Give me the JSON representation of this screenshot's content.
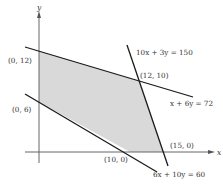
{
  "diagram": {
    "type": "linear-programming-feasible-region",
    "axes": {
      "x_label": "x",
      "y_label": "y"
    },
    "colors": {
      "region_fill": "#d9d9d9",
      "line": "#1a1a1a",
      "axis": "#555555",
      "text": "#333333"
    },
    "constraints": [
      {
        "id": "c1",
        "label": "10x + 3y = 150"
      },
      {
        "id": "c2",
        "label": "x + 6y = 72"
      },
      {
        "id": "c3",
        "label": "6x + 10y = 60"
      }
    ],
    "vertices": [
      {
        "id": "v1",
        "label": "(0, 12)"
      },
      {
        "id": "v2",
        "label": "(12, 10)"
      },
      {
        "id": "v3",
        "label": "(15, 0)"
      },
      {
        "id": "v4",
        "label": "(10, 0)"
      },
      {
        "id": "v5",
        "label": "(0, 6)"
      }
    ]
  }
}
